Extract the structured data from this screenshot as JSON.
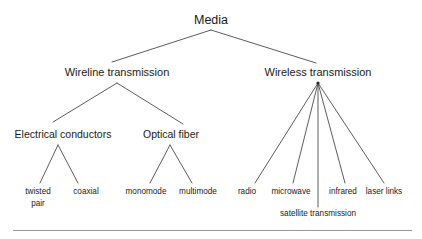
{
  "diagram": {
    "title": "Media",
    "type": "tree",
    "background_color": "#ffffff",
    "line_color": "#4a4a4a",
    "text_color": "#1a1a1a",
    "rule_color": "#999999",
    "nodes": {
      "root": {
        "label": "Media",
        "x": 211,
        "y": 20
      },
      "wireline": {
        "label": "Wireline transmission",
        "x": 117,
        "y": 72
      },
      "wireless": {
        "label": "Wireless transmission",
        "x": 318,
        "y": 72
      },
      "electrical": {
        "label": "Electrical conductors",
        "x": 63,
        "y": 134
      },
      "optical": {
        "label": "Optical fiber",
        "x": 171,
        "y": 134
      },
      "twisted_pair_line1": {
        "label": "twisted",
        "x": 38,
        "y": 192
      },
      "twisted_pair_line2": {
        "label": "pair",
        "x": 38,
        "y": 204
      },
      "coaxial": {
        "label": "coaxial",
        "x": 86,
        "y": 192
      },
      "monomode": {
        "label": "monomode",
        "x": 146,
        "y": 192
      },
      "multimode": {
        "label": "multimode",
        "x": 198,
        "y": 192
      },
      "radio": {
        "label": "radio",
        "x": 247,
        "y": 192
      },
      "microwave": {
        "label": "microwave",
        "x": 291,
        "y": 192
      },
      "infrared": {
        "label": "infrared",
        "x": 343,
        "y": 192
      },
      "laser_links": {
        "label": "laser links",
        "x": 384,
        "y": 192
      },
      "satellite": {
        "label": "satellite transmission",
        "x": 318,
        "y": 214
      }
    },
    "twisted_pair_full": "twisted pair",
    "edges": [
      {
        "name": "media-to-wireline",
        "x1": 211,
        "y1": 30,
        "x2": 112,
        "y2": 62
      },
      {
        "name": "media-to-wireless",
        "x1": 211,
        "y1": 30,
        "x2": 316,
        "y2": 63
      },
      {
        "name": "wireline-to-electrical",
        "x1": 117,
        "y1": 83,
        "x2": 53,
        "y2": 122
      },
      {
        "name": "wireline-to-optical",
        "x1": 117,
        "y1": 83,
        "x2": 183,
        "y2": 124
      },
      {
        "name": "electrical-to-twisted-pair",
        "x1": 58,
        "y1": 145,
        "x2": 40,
        "y2": 183
      },
      {
        "name": "electrical-to-coaxial",
        "x1": 58,
        "y1": 145,
        "x2": 78,
        "y2": 183
      },
      {
        "name": "optical-to-monomode",
        "x1": 170,
        "y1": 145,
        "x2": 150,
        "y2": 183
      },
      {
        "name": "optical-to-multimode",
        "x1": 170,
        "y1": 145,
        "x2": 192,
        "y2": 183
      },
      {
        "name": "wireless-to-radio",
        "x1": 318,
        "y1": 83,
        "x2": 255,
        "y2": 183
      },
      {
        "name": "wireless-to-microwave",
        "x1": 318,
        "y1": 83,
        "x2": 293,
        "y2": 183
      },
      {
        "name": "wireless-to-satellite",
        "x1": 318,
        "y1": 83,
        "x2": 318,
        "y2": 207
      },
      {
        "name": "wireless-to-infrared",
        "x1": 318,
        "y1": 83,
        "x2": 345,
        "y2": 183
      },
      {
        "name": "wireless-to-laser-links",
        "x1": 318,
        "y1": 83,
        "x2": 384,
        "y2": 183
      }
    ],
    "footer_rule": {
      "x": 13,
      "y": 230,
      "width": 399
    }
  }
}
